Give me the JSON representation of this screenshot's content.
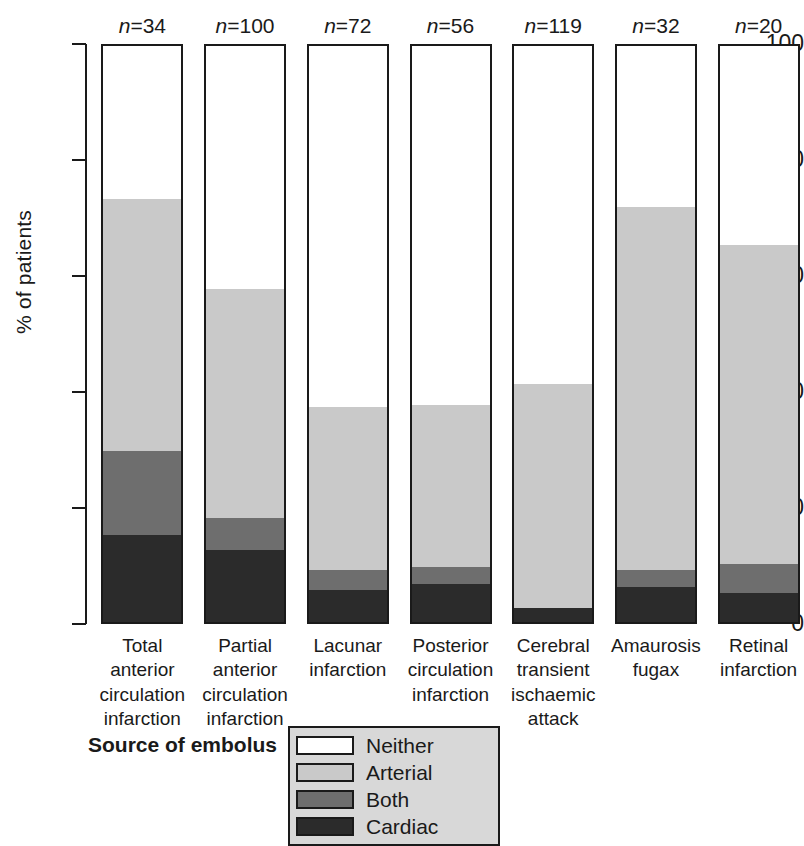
{
  "chart_data": {
    "type": "bar",
    "title": "",
    "xlabel": "",
    "ylabel": "% of patients",
    "ylim": [
      0,
      100
    ],
    "yticks": [
      0,
      20,
      40,
      60,
      80,
      100
    ],
    "grid": false,
    "stacked": true,
    "legend_position": "bottom",
    "legend_title": "Source of embolus",
    "categories": [
      "Total anterior circulation infarction",
      "Partial anterior circulation infarction",
      "Lacunar infarction",
      "Posterior circulation infarction",
      "Cerebral transient ischaemic attack",
      "Amaurosis fugax",
      "Retinal infarction"
    ],
    "category_lines": [
      [
        "Total",
        "anterior",
        "circulation",
        "infarction"
      ],
      [
        "Partial",
        "anterior",
        "circulation",
        "infarction"
      ],
      [
        "Lacunar",
        "infarction"
      ],
      [
        "Posterior",
        "circulation",
        "infarction"
      ],
      [
        "Cerebral",
        "transient",
        "ischaemic",
        "attack"
      ],
      [
        "Amaurosis",
        "fugax"
      ],
      [
        "Retinal",
        "infarction"
      ]
    ],
    "n_labels": [
      "n=34",
      "n=100",
      "n=72",
      "n=56",
      "n=119",
      "n=32",
      "n=20"
    ],
    "n_values": [
      34,
      100,
      72,
      56,
      119,
      32,
      20
    ],
    "series": [
      {
        "name": "Cardiac",
        "color": "#2b2b2b",
        "values": [
          15.0,
          12.5,
          5.5,
          6.5,
          2.5,
          6.0,
          5.0
        ]
      },
      {
        "name": "Both",
        "color": "#6e6e6e",
        "values": [
          14.5,
          5.5,
          3.5,
          3.0,
          0.0,
          3.0,
          5.0
        ]
      },
      {
        "name": "Arterial",
        "color": "#c9c9c9",
        "values": [
          43.5,
          39.5,
          28.0,
          28.0,
          38.5,
          62.5,
          55.0
        ]
      },
      {
        "name": "Neither",
        "color": "#ffffff",
        "values": [
          27.0,
          42.5,
          63.0,
          62.5,
          59.0,
          28.5,
          35.0
        ]
      }
    ],
    "legend_entries": [
      {
        "label": "Neither",
        "color": "#ffffff"
      },
      {
        "label": "Arterial",
        "color": "#c9c9c9"
      },
      {
        "label": "Both",
        "color": "#6e6e6e"
      },
      {
        "label": "Cardiac",
        "color": "#2b2b2b"
      }
    ]
  }
}
